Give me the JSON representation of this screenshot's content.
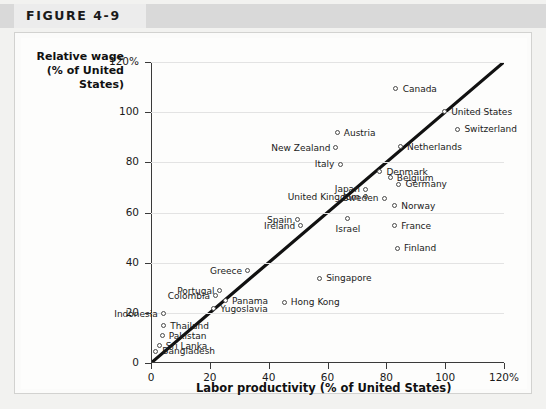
{
  "figure": {
    "tag": "FIGURE 4-9"
  },
  "chart_data": {
    "type": "scatter",
    "title": "FIGURE 4-9",
    "xlabel": "Labor productivity (% of United States)",
    "ylabel": "Relative wage\n(% of United States)",
    "ylabel_lines": [
      "Relative wage",
      "(% of United",
      "States)"
    ],
    "xlim": [
      0,
      120
    ],
    "ylim": [
      0,
      120
    ],
    "xticks": [
      "0",
      "20",
      "40",
      "60",
      "80",
      "100",
      "120%"
    ],
    "xtick_values": [
      0,
      20,
      40,
      60,
      80,
      100,
      120
    ],
    "yticks": [
      "0",
      "20",
      "40",
      "60",
      "80",
      "100",
      "120%"
    ],
    "ytick_values": [
      0,
      20,
      40,
      60,
      80,
      100,
      120
    ],
    "grid": "horizontal",
    "legend": "none",
    "reference_line": {
      "label": "45-degree line",
      "from": [
        0,
        0
      ],
      "to": [
        120,
        120
      ],
      "color": "#111111"
    },
    "marker_color": "#4a4a4a",
    "points": [
      {
        "name": "Canada",
        "x": 83.5,
        "y": 109.0,
        "label_side": "right"
      },
      {
        "name": "United States",
        "x": 100.0,
        "y": 100.0,
        "label_side": "right"
      },
      {
        "name": "Switzerland",
        "x": 104.5,
        "y": 93.0,
        "label_side": "right"
      },
      {
        "name": "Austria",
        "x": 63.5,
        "y": 91.5,
        "label_side": "right"
      },
      {
        "name": "Netherlands",
        "x": 85.0,
        "y": 86.0,
        "label_side": "right"
      },
      {
        "name": "New Zealand",
        "x": 63.0,
        "y": 85.5,
        "label_side": "left"
      },
      {
        "name": "Italy",
        "x": 64.5,
        "y": 79.0,
        "label_side": "left"
      },
      {
        "name": "Denmark",
        "x": 78.0,
        "y": 76.0,
        "label_side": "right"
      },
      {
        "name": "Belgium",
        "x": 81.5,
        "y": 73.5,
        "label_side": "right"
      },
      {
        "name": "Germany",
        "x": 84.5,
        "y": 71.0,
        "label_side": "right"
      },
      {
        "name": "Japan",
        "x": 73.0,
        "y": 69.0,
        "label_side": "left"
      },
      {
        "name": "United Kingdom",
        "x": 73.0,
        "y": 66.0,
        "label_side": "left"
      },
      {
        "name": "Sweden",
        "x": 79.5,
        "y": 65.5,
        "label_side": "left"
      },
      {
        "name": "Norway",
        "x": 83.0,
        "y": 62.5,
        "label_side": "right"
      },
      {
        "name": "Spain",
        "x": 50.0,
        "y": 57.0,
        "label_side": "left"
      },
      {
        "name": "Ireland",
        "x": 51.0,
        "y": 54.5,
        "label_side": "left"
      },
      {
        "name": "Israel",
        "x": 67.0,
        "y": 57.5,
        "label_side": "below"
      },
      {
        "name": "France",
        "x": 83.0,
        "y": 54.5,
        "label_side": "right"
      },
      {
        "name": "Finland",
        "x": 84.0,
        "y": 45.5,
        "label_side": "right"
      },
      {
        "name": "Greece",
        "x": 33.0,
        "y": 36.5,
        "label_side": "left"
      },
      {
        "name": "Singapore",
        "x": 57.5,
        "y": 33.5,
        "label_side": "right"
      },
      {
        "name": "Portugal",
        "x": 23.5,
        "y": 28.5,
        "label_side": "left"
      },
      {
        "name": "Colombia",
        "x": 22.0,
        "y": 26.5,
        "label_side": "left"
      },
      {
        "name": "Panama",
        "x": 25.5,
        "y": 24.5,
        "label_side": "right"
      },
      {
        "name": "Hong Kong",
        "x": 45.5,
        "y": 24.0,
        "label_side": "right"
      },
      {
        "name": "Indonesia",
        "x": 4.5,
        "y": 19.5,
        "label_side": "left"
      },
      {
        "name": "Yugoslavia",
        "x": 21.5,
        "y": 21.5,
        "label_side": "right"
      },
      {
        "name": "Thailand",
        "x": 4.5,
        "y": 14.5,
        "label_side": "right"
      },
      {
        "name": "Pakistan",
        "x": 4.0,
        "y": 10.5,
        "label_side": "right"
      },
      {
        "name": "Sri Lanka",
        "x": 3.0,
        "y": 6.5,
        "label_side": "right"
      },
      {
        "name": "Bangladesh",
        "x": 1.8,
        "y": 4.5,
        "label_side": "right"
      }
    ]
  }
}
